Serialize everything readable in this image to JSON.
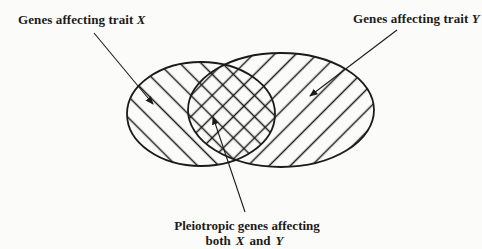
{
  "colors": {
    "ink": "#1b1b1b",
    "background": "#fbfbf9"
  },
  "labels": {
    "left": {
      "text": "Genes affecting trait",
      "trait": "X"
    },
    "right": {
      "text": "Genes affecting trait",
      "trait": "Y"
    },
    "caption": {
      "line1": "Pleiotropic genes affecting",
      "both": "both",
      "x": "X",
      "and": "and",
      "y": "Y"
    }
  },
  "diagram": {
    "type": "venn",
    "sets": [
      {
        "name": "Genes affecting trait X",
        "hatch": "backslash-diagonal"
      },
      {
        "name": "Genes affecting trait Y",
        "hatch": "slash-diagonal"
      },
      {
        "name": "Pleiotropic genes affecting both X and Y",
        "hatch": "cross-hatch (intersection)"
      }
    ]
  }
}
